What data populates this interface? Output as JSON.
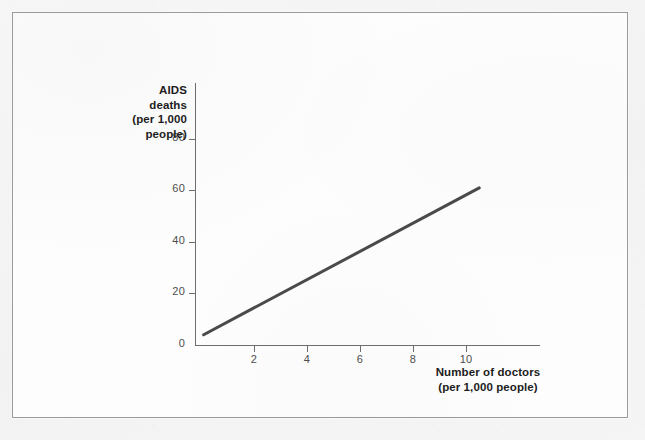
{
  "figure": {
    "background_color": "#fdfdfd",
    "border_color": "#9a9a9a",
    "outer_background_color": "#f4f4f4"
  },
  "chart_data": {
    "type": "line",
    "title": "",
    "subtitle": "",
    "xlabel": "Number of doctors (per 1,000 people)",
    "ylabel": "AIDS deaths (per 1,000 people)",
    "xlabel_lines": [
      "Number of doctors",
      "(per 1,000 people)"
    ],
    "ylabel_lines": [
      "AIDS",
      "deaths",
      "(per 1,000",
      "people)"
    ],
    "xlim": [
      0,
      11.4
    ],
    "ylim": [
      0,
      101
    ],
    "xticks": [
      2,
      4,
      6,
      8,
      10
    ],
    "xtick_labels": [
      "2",
      "4",
      "6",
      "8",
      "10"
    ],
    "yticks": [
      0,
      20,
      40,
      60,
      80
    ],
    "ytick_labels": [
      "0",
      "20",
      "40",
      "60",
      "80"
    ],
    "grid": false,
    "legend": false,
    "legend_position": "none",
    "line_color": "#4a4a4a",
    "line_width_px": 3,
    "series": [
      {
        "name": "AIDS deaths vs doctors trend",
        "x": [
          0.1,
          10.5
        ],
        "values": [
          4,
          61
        ]
      }
    ],
    "annotations": []
  },
  "axes": {
    "axis_color": "#6e6e6e",
    "tick_color": "#6e6e6e",
    "tick_label_color": "#4d4d4d",
    "title_color": "#1d1d1d"
  }
}
